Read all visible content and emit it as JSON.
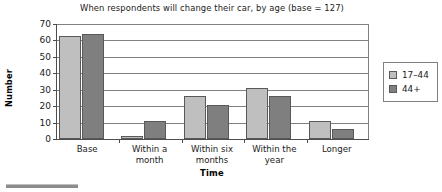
{
  "chart_data": {
    "type": "bar",
    "title": "When respondents will change their car, by age (base = 127)",
    "xlabel": "Time",
    "ylabel": "Number",
    "categories": [
      "Base",
      "Within a\nmonth",
      "Within six\nmonths",
      "Within the\nyear",
      "Longer"
    ],
    "category_lines": [
      [
        "Base"
      ],
      [
        "Within a",
        "month"
      ],
      [
        "Within six",
        "months"
      ],
      [
        "Within the",
        "year"
      ],
      [
        "Longer"
      ]
    ],
    "series": [
      {
        "name": "17–44",
        "color": "#bfbfbf",
        "values": [
          63,
          2,
          26,
          31,
          11
        ]
      },
      {
        "name": "44+",
        "color": "#7f7f7f",
        "values": [
          64,
          11,
          21,
          26,
          6
        ]
      }
    ],
    "ylim": [
      0,
      70
    ],
    "yticks": [
      0,
      10,
      20,
      30,
      40,
      50,
      60,
      70
    ],
    "ytick_labels": [
      "0",
      "10",
      "20",
      "30",
      "40",
      "50",
      "60",
      "70"
    ],
    "grid": true,
    "grid_axis": "y",
    "legend_position": "right-outside"
  },
  "colors": {
    "series_light": "#bfbfbf",
    "series_dark": "#7f7f7f",
    "axis": "#4d4d4d",
    "grid": "#808080",
    "text": "#1a1a1a",
    "background": "#ffffff"
  }
}
